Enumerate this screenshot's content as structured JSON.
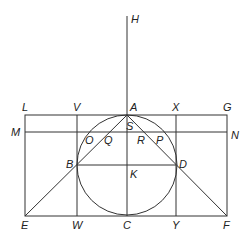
{
  "diagram": {
    "type": "geometric-construction",
    "colors": {
      "stroke": "#333333",
      "label": "#222222",
      "background": "#ffffff"
    },
    "points": {
      "H": {
        "label": "H"
      },
      "L": {
        "label": "L"
      },
      "V": {
        "label": "V"
      },
      "A": {
        "label": "A"
      },
      "X": {
        "label": "X"
      },
      "G": {
        "label": "G"
      },
      "M": {
        "label": "M"
      },
      "N": {
        "label": "N"
      },
      "S": {
        "label": "S"
      },
      "O": {
        "label": "O"
      },
      "Q": {
        "label": "Q"
      },
      "R": {
        "label": "R"
      },
      "P": {
        "label": "P"
      },
      "B": {
        "label": "B"
      },
      "D": {
        "label": "D"
      },
      "K": {
        "label": "K"
      },
      "E": {
        "label": "E"
      },
      "W": {
        "label": "W"
      },
      "C": {
        "label": "C"
      },
      "Y": {
        "label": "Y"
      },
      "F": {
        "label": "F"
      }
    }
  }
}
